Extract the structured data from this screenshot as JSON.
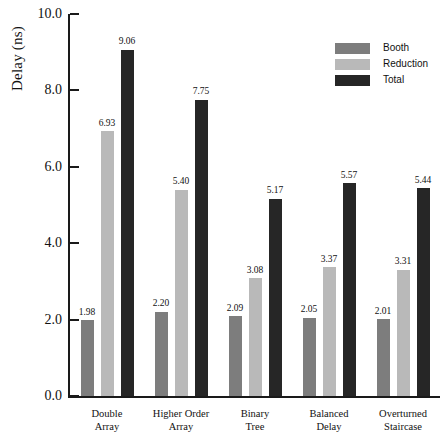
{
  "chart_data": {
    "type": "bar",
    "title": "",
    "xlabel": "",
    "ylabel": "Delay (ns)",
    "ylim": [
      0.0,
      10.0
    ],
    "ytick_step": 2.0,
    "ytick_labels": [
      "10.0",
      "8.0",
      "6.0",
      "4.0",
      "2.0",
      "0.0"
    ],
    "ytick_values": [
      10.0,
      8.0,
      6.0,
      4.0,
      2.0,
      0.0
    ],
    "grid": false,
    "legend_position": "top-right",
    "categories": [
      "Double Array",
      "Higher Order Array",
      "Binary Tree",
      "Balanced Delay",
      "Overturned Staircase"
    ],
    "category_lines": [
      [
        "Double",
        "Array"
      ],
      [
        "Higher Order",
        "Array"
      ],
      [
        "Binary",
        "Tree"
      ],
      [
        "Balanced",
        "Delay"
      ],
      [
        "Overturned",
        "Staircase"
      ]
    ],
    "series": [
      {
        "name": "Booth",
        "color": "#7d7d7d",
        "values": [
          1.98,
          2.2,
          2.09,
          2.05,
          2.01
        ],
        "labels": [
          "1.98",
          "2.20",
          "2.09",
          "2.05",
          "2.01"
        ]
      },
      {
        "name": "Reduction",
        "color": "#b9b9b9",
        "values": [
          6.93,
          5.4,
          3.08,
          3.37,
          3.31
        ],
        "labels": [
          "6.93",
          "5.40",
          "3.08",
          "3.37",
          "3.31"
        ]
      },
      {
        "name": "Total",
        "color": "#262626",
        "values": [
          9.06,
          7.75,
          5.17,
          5.57,
          5.44
        ],
        "labels": [
          "9.06",
          "7.75",
          "5.17",
          "5.57",
          "5.44"
        ]
      }
    ]
  },
  "legend": {
    "entries": [
      {
        "label": "Booth",
        "color": "#7d7d7d"
      },
      {
        "label": "Reduction",
        "color": "#b9b9b9"
      },
      {
        "label": "Total",
        "color": "#262626"
      }
    ]
  },
  "axes": {
    "y_title": "Delay (ns)"
  }
}
